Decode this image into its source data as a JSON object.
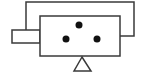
{
  "diagram": {
    "type": "schematic-symbol",
    "stroke_color": "#3a3a3a",
    "fill_color": "#ffffff",
    "dot_color": "#111111",
    "stroke_width": 1.5,
    "outer_frame": {
      "points": "26,30 26,2 134,2 134,36 120,36"
    },
    "main_body": {
      "x": 40,
      "y": 16,
      "width": 80,
      "height": 40
    },
    "left_port": {
      "x": 12,
      "y": 30,
      "width": 28,
      "height": 13
    },
    "dots": [
      {
        "cx": 79,
        "cy": 25,
        "r": 3.5
      },
      {
        "cx": 66,
        "cy": 39,
        "r": 3.5
      },
      {
        "cx": 97,
        "cy": 39,
        "r": 3.5
      }
    ],
    "base_triangle": {
      "points": "82,57 74,71 91,71"
    }
  }
}
